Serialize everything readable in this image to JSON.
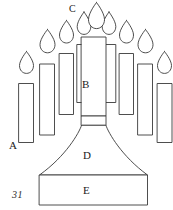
{
  "figure": {
    "number": "31",
    "stroke_color": "#3a3a3a",
    "fill_color": "#ffffff",
    "background_color": "#ffffff"
  },
  "labels": {
    "a": "A",
    "b": "B",
    "c": "C",
    "d": "D",
    "e": "E"
  },
  "label_targets": {
    "a": "outer-left-candle",
    "b": "center-candle-body",
    "c": "center-candle-flame",
    "d": "flared-stem",
    "e": "rectangular-base"
  },
  "candles": [
    {
      "id": "candle-1",
      "label": "A",
      "x": 18,
      "y": 83,
      "w": 14,
      "h": 58,
      "flame_cx": 25,
      "flame_cy": 70
    },
    {
      "id": "candle-2",
      "label": "",
      "x": 40,
      "y": 68,
      "w": 14,
      "h": 65,
      "flame_cx": 47,
      "flame_cy": 55
    },
    {
      "id": "candle-3",
      "label": "",
      "x": 60,
      "y": 56,
      "w": 13,
      "h": 56,
      "flame_cx": 66,
      "flame_cy": 43
    },
    {
      "id": "candle-4",
      "label": "",
      "x": 77,
      "y": 45,
      "w": 13,
      "h": 55,
      "flame_cx": 83,
      "flame_cy": 32
    },
    {
      "id": "candle-5",
      "label": "B",
      "x": 95,
      "y": 33,
      "w": 22,
      "h": 88,
      "flame_cx": 106,
      "flame_cy": 19
    },
    {
      "id": "candle-6",
      "label": "",
      "x": 122,
      "y": 45,
      "w": 13,
      "h": 55,
      "flame_cx": 128,
      "flame_cy": 32
    },
    {
      "id": "candle-7",
      "label": "",
      "x": 140,
      "y": 56,
      "w": 13,
      "h": 56,
      "flame_cx": 146,
      "flame_cy": 43
    },
    {
      "id": "candle-8",
      "label": "",
      "x": 157,
      "y": 68,
      "w": 14,
      "h": 65,
      "flame_cx": 164,
      "flame_cy": 55
    },
    {
      "id": "candle-9",
      "label": "",
      "x": 176,
      "y": 83,
      "w": 14,
      "h": 58,
      "flame_cx": 183,
      "flame_cy": 70
    }
  ],
  "parts": {
    "center_candle": {
      "name": "center-candle-body"
    },
    "neck": {
      "name": "neck"
    },
    "flare": {
      "name": "flared-stem"
    },
    "base": {
      "name": "rectangular-base"
    }
  }
}
